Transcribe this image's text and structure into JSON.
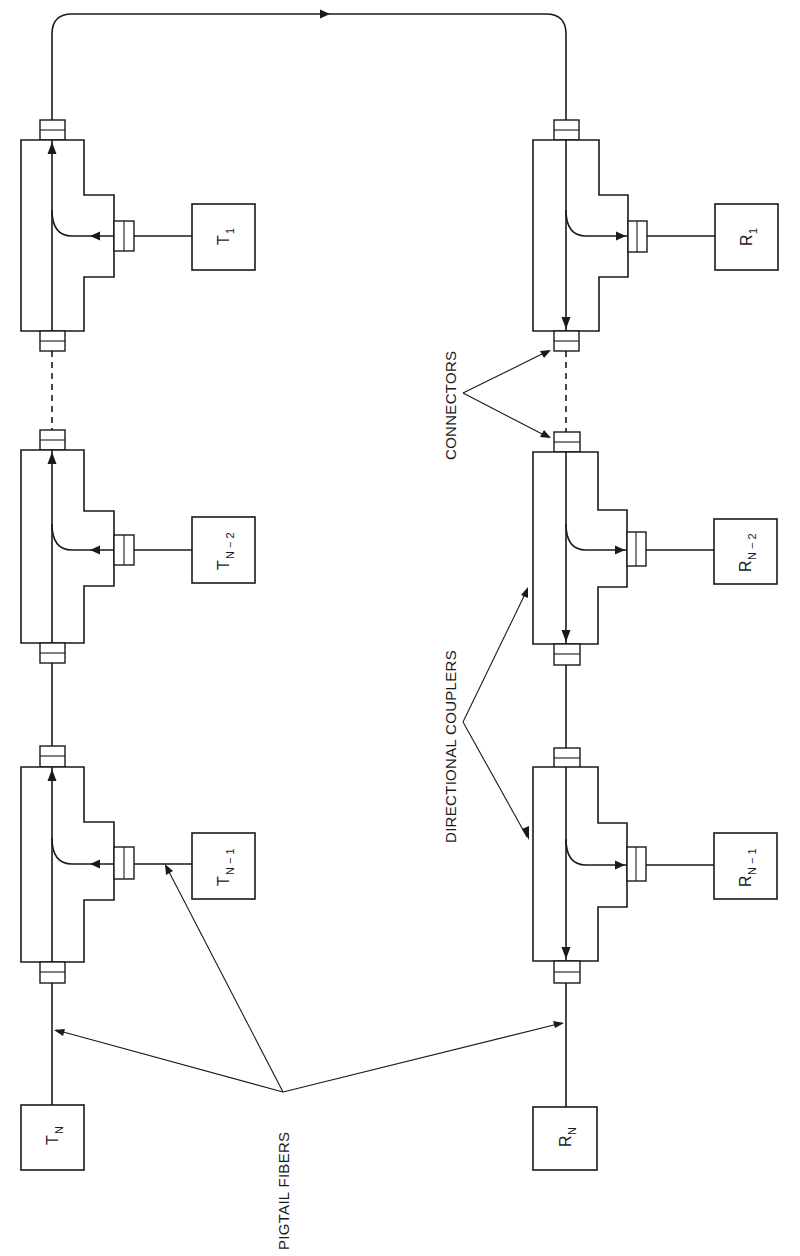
{
  "figure": {
    "transmitters": [
      {
        "id": "T1",
        "main": "T",
        "sub": "1"
      },
      {
        "id": "TN-2",
        "main": "T",
        "sub": "N − 2"
      },
      {
        "id": "TN-1",
        "main": "T",
        "sub": "N − 1"
      },
      {
        "id": "TN",
        "main": "T",
        "sub": "N"
      }
    ],
    "receivers": [
      {
        "id": "R1",
        "main": "R",
        "sub": "1"
      },
      {
        "id": "RN-2",
        "main": "R",
        "sub": "N − 2"
      },
      {
        "id": "RN-1",
        "main": "R",
        "sub": "N − 1"
      },
      {
        "id": "RN",
        "main": "R",
        "sub": "N"
      }
    ],
    "callouts": {
      "connectors": "CONNECTORS",
      "directional_couplers": "DIRECTIONAL COUPLERS",
      "pigtail_fibers": "PIGTAIL FIBERS"
    }
  }
}
